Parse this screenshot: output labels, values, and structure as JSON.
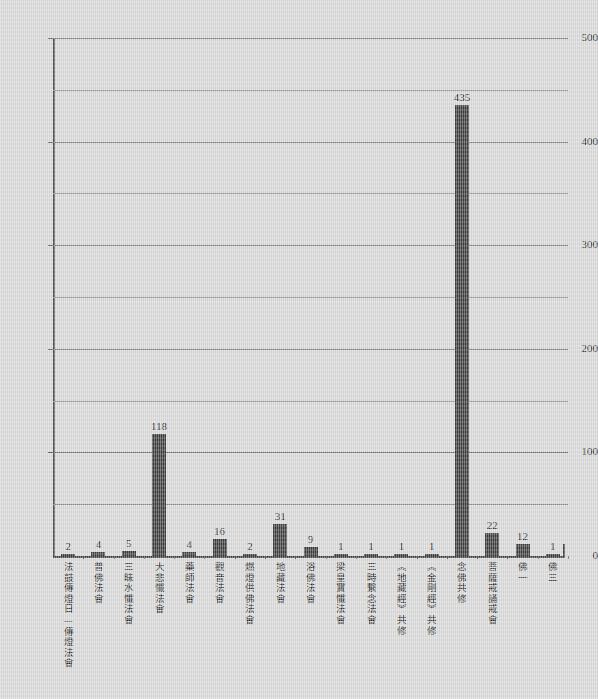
{
  "chart_data": {
    "type": "bar",
    "title": "",
    "subtitle": "",
    "xlabel": "",
    "ylabel": "",
    "ylim": [
      0,
      500
    ],
    "y_ticks": [
      0,
      100,
      200,
      300,
      400,
      500
    ],
    "y_tick_labels": [
      "0",
      "100",
      "200",
      "300",
      "400",
      "500"
    ],
    "y_minor_gridlines": [
      50,
      150,
      250,
      350,
      450
    ],
    "grid": true,
    "legend": "none",
    "bar_color": "#3a3a3a",
    "background_color": "#d8d8d8",
    "show_value_labels": true,
    "categories": [
      "法鼓傳燈日—傳燈法會",
      "普佛法會",
      "三昧水懺法會",
      "大悲懺法會",
      "藥師法會",
      "觀音法會",
      "燃燈供佛法會",
      "地藏法會",
      "浴佛法會",
      "梁皇寶懺法會",
      "三時繫念法會",
      "《地藏經》共修",
      "《金剛經》共修",
      "念佛共修",
      "菩薩戒誦戒會",
      "佛一",
      "佛三"
    ],
    "values": [
      2,
      4,
      5,
      118,
      4,
      16,
      2,
      31,
      9,
      1,
      1,
      1,
      1,
      435,
      22,
      12,
      1
    ],
    "value_labels": [
      "2",
      "4",
      "5",
      "118",
      "4",
      "16",
      "2",
      "31",
      "9",
      "1",
      "1",
      "1",
      "1",
      "435",
      "22",
      "12",
      "1"
    ]
  }
}
